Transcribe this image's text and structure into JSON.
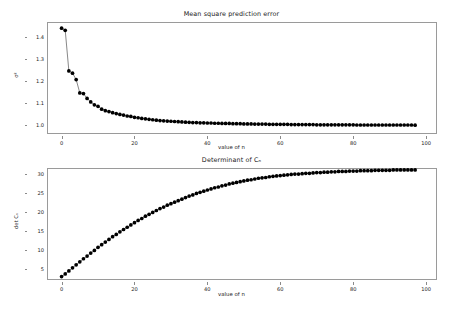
{
  "figure": {
    "width": 463,
    "height": 311,
    "background": "#ffffff",
    "marker_color": "#000000",
    "line_color": "#555555",
    "spine_color": "#9a9a9a"
  },
  "chart_data": [
    {
      "type": "line",
      "id": "mean-square-prediction-error",
      "title": "Mean square prediction error",
      "xlabel": "value of n",
      "ylabel": "σ²",
      "xlim": [
        -4,
        103
      ],
      "ylim": [
        0.96,
        1.47
      ],
      "xticks": [
        0,
        20,
        40,
        60,
        80,
        100
      ],
      "yticks": [
        1.0,
        1.1,
        1.2,
        1.3,
        1.4
      ],
      "xticklabels": [
        "0",
        "20",
        "40",
        "60",
        "80",
        "100"
      ],
      "yticklabels": [
        "1.0",
        "1.1",
        "1.2",
        "1.3",
        "1.4"
      ],
      "grid": false,
      "legend": null,
      "marker": "o",
      "x": [
        0,
        1,
        2,
        3,
        4,
        5,
        6,
        7,
        8,
        9,
        10,
        11,
        12,
        13,
        14,
        15,
        16,
        17,
        18,
        19,
        20,
        21,
        22,
        23,
        24,
        25,
        26,
        27,
        28,
        29,
        30,
        31,
        32,
        33,
        34,
        35,
        36,
        37,
        38,
        39,
        40,
        41,
        42,
        43,
        44,
        45,
        46,
        47,
        48,
        49,
        50,
        51,
        52,
        53,
        54,
        55,
        56,
        57,
        58,
        59,
        60,
        61,
        62,
        63,
        64,
        65,
        66,
        67,
        68,
        69,
        70,
        71,
        72,
        73,
        74,
        75,
        76,
        77,
        78,
        79,
        80,
        81,
        82,
        83,
        84,
        85,
        86,
        87,
        88,
        89,
        90,
        91,
        92,
        93,
        94,
        95,
        96,
        97
      ],
      "values": [
        1.442,
        1.432,
        1.247,
        1.237,
        1.208,
        1.147,
        1.144,
        1.122,
        1.106,
        1.093,
        1.086,
        1.073,
        1.066,
        1.062,
        1.057,
        1.053,
        1.049,
        1.046,
        1.042,
        1.04,
        1.036,
        1.034,
        1.031,
        1.029,
        1.027,
        1.025,
        1.023,
        1.021,
        1.02,
        1.019,
        1.018,
        1.017,
        1.016,
        1.015,
        1.014,
        1.013,
        1.012,
        1.012,
        1.011,
        1.011,
        1.01,
        1.01,
        1.009,
        1.009,
        1.008,
        1.008,
        1.008,
        1.007,
        1.007,
        1.007,
        1.006,
        1.006,
        1.006,
        1.005,
        1.005,
        1.005,
        1.005,
        1.004,
        1.004,
        1.004,
        1.004,
        1.004,
        1.004,
        1.003,
        1.003,
        1.003,
        1.003,
        1.003,
        1.003,
        1.003,
        1.002,
        1.002,
        1.002,
        1.002,
        1.002,
        1.002,
        1.002,
        1.002,
        1.002,
        1.002,
        1.002,
        1.001,
        1.001,
        1.001,
        1.001,
        1.001,
        1.001,
        1.001,
        1.001,
        1.001,
        1.001,
        1.001,
        1.001,
        1.001,
        1.001,
        1.001,
        1.001,
        1.0
      ]
    },
    {
      "type": "line",
      "id": "determinant-of-cn",
      "title": "Determinant of Cₙ",
      "xlabel": "value of n",
      "ylabel": "det Cₙ",
      "xlim": [
        -4,
        103
      ],
      "ylim": [
        2.0,
        31.5
      ],
      "xticks": [
        0,
        20,
        40,
        60,
        80,
        100
      ],
      "yticks": [
        5,
        10,
        15,
        20,
        25,
        30
      ],
      "xticklabels": [
        "0",
        "20",
        "40",
        "60",
        "80",
        "100"
      ],
      "yticklabels": [
        "5",
        "10",
        "15",
        "20",
        "25",
        "30"
      ],
      "grid": false,
      "legend": null,
      "marker": "o",
      "x": [
        0,
        1,
        2,
        3,
        4,
        5,
        6,
        7,
        8,
        9,
        10,
        11,
        12,
        13,
        14,
        15,
        16,
        17,
        18,
        19,
        20,
        21,
        22,
        23,
        24,
        25,
        26,
        27,
        28,
        29,
        30,
        31,
        32,
        33,
        34,
        35,
        36,
        37,
        38,
        39,
        40,
        41,
        42,
        43,
        44,
        45,
        46,
        47,
        48,
        49,
        50,
        51,
        52,
        53,
        54,
        55,
        56,
        57,
        58,
        59,
        60,
        61,
        62,
        63,
        64,
        65,
        66,
        67,
        68,
        69,
        70,
        71,
        72,
        73,
        74,
        75,
        76,
        77,
        78,
        79,
        80,
        81,
        82,
        83,
        84,
        85,
        86,
        87,
        88,
        89,
        90,
        91,
        92,
        93,
        94,
        95,
        96,
        97
      ],
      "values": [
        2.9,
        3.6,
        4.4,
        5.2,
        6.0,
        6.8,
        7.6,
        8.3,
        9.1,
        9.8,
        10.6,
        11.3,
        12.0,
        12.7,
        13.4,
        14.0,
        14.7,
        15.3,
        15.9,
        16.5,
        17.1,
        17.7,
        18.2,
        18.8,
        19.3,
        19.8,
        20.3,
        20.8,
        21.2,
        21.7,
        22.1,
        22.5,
        22.9,
        23.3,
        23.7,
        24.1,
        24.4,
        24.8,
        25.1,
        25.4,
        25.7,
        26.0,
        26.3,
        26.5,
        26.8,
        27.0,
        27.3,
        27.5,
        27.7,
        27.9,
        28.1,
        28.3,
        28.4,
        28.6,
        28.8,
        28.9,
        29.0,
        29.2,
        29.3,
        29.4,
        29.5,
        29.6,
        29.7,
        29.8,
        29.9,
        29.9,
        30.0,
        30.1,
        30.1,
        30.2,
        30.3,
        30.3,
        30.4,
        30.4,
        30.5,
        30.5,
        30.6,
        30.6,
        30.6,
        30.7,
        30.7,
        30.7,
        30.8,
        30.8,
        30.8,
        30.8,
        30.9,
        30.9,
        30.9,
        30.9,
        30.9,
        31.0,
        31.0,
        31.0,
        31.0,
        31.0,
        31.0,
        31.0
      ]
    }
  ]
}
